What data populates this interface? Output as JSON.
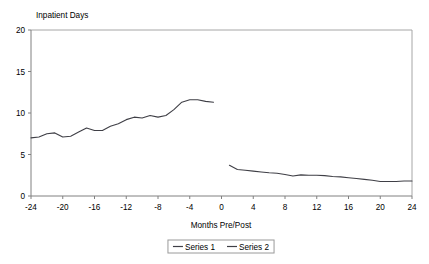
{
  "chart_data": {
    "type": "line",
    "title": "",
    "ylabel": "Inpatient Days",
    "xlabel": "Months Pre/Post",
    "xlim": [
      -24,
      24
    ],
    "ylim": [
      0,
      20
    ],
    "xticks": [
      -24,
      -20,
      -16,
      -12,
      -8,
      -4,
      0,
      4,
      8,
      12,
      16,
      20,
      24
    ],
    "yticks": [
      0,
      5,
      10,
      15,
      20
    ],
    "xtick_labels": [
      "-24",
      "-20",
      "-16",
      "-12",
      "-8",
      "-4",
      "0",
      "4",
      "8",
      "12",
      "16",
      "20",
      "24"
    ],
    "ytick_labels": [
      "0",
      "5",
      "10",
      "15",
      "20"
    ],
    "grid": false,
    "legend_position": "bottom",
    "series": [
      {
        "name": "Series 1",
        "color": "#3f3f46",
        "x": [
          -24,
          -23,
          -22,
          -21,
          -20,
          -19,
          -18,
          -17,
          -16,
          -15,
          -14,
          -13,
          -12,
          -11,
          -10,
          -9,
          -8,
          -7,
          -6,
          -5,
          -4,
          -3,
          -2,
          -1
        ],
        "values": [
          7.0,
          7.1,
          7.5,
          7.6,
          7.1,
          7.2,
          7.7,
          8.2,
          7.9,
          7.9,
          8.4,
          8.7,
          9.2,
          9.5,
          9.4,
          9.7,
          9.5,
          9.7,
          10.4,
          11.3,
          11.6,
          11.6,
          11.4,
          11.3
        ]
      },
      {
        "name": "Series 2",
        "color": "#3f3f46",
        "x": [
          1,
          2,
          3,
          4,
          5,
          6,
          7,
          8,
          9,
          10,
          11,
          12,
          13,
          14,
          15,
          16,
          17,
          18,
          19,
          20,
          21,
          22,
          23,
          24
        ],
        "values": [
          3.7,
          3.2,
          3.1,
          3.0,
          2.9,
          2.8,
          2.75,
          2.6,
          2.4,
          2.55,
          2.5,
          2.5,
          2.45,
          2.35,
          2.3,
          2.2,
          2.1,
          2.0,
          1.9,
          1.75,
          1.75,
          1.75,
          1.8,
          1.8
        ]
      }
    ],
    "legend": [
      {
        "label": "Series 1",
        "color": "#3f3f46"
      },
      {
        "label": "Series 2",
        "color": "#3f3f46"
      }
    ]
  }
}
